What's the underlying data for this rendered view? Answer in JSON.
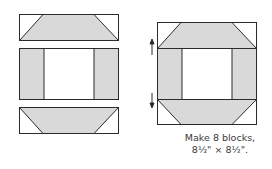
{
  "diagram": {
    "colors": {
      "fill": "#d9d9d9",
      "background": "#ffffff",
      "stroke": "#2b2b2b",
      "text": "#3a3a3a"
    },
    "left_pieces": [
      {
        "name": "top-strip",
        "shape": "trapezoid-strip",
        "corner_triangles": "top-left, top-right"
      },
      {
        "name": "middle-unit",
        "shape": "side-rectangles-with-center-square"
      },
      {
        "name": "bottom-strip",
        "shape": "trapezoid-strip",
        "corner_triangles": "bottom-left, bottom-right"
      }
    ],
    "assembled_block": {
      "arrows": [
        {
          "direction": "up",
          "position": "top seam"
        },
        {
          "direction": "down",
          "position": "bottom seam"
        }
      ]
    },
    "caption": {
      "line1": "Make 8 blocks,",
      "line2": "8½\" × 8½\"."
    }
  }
}
